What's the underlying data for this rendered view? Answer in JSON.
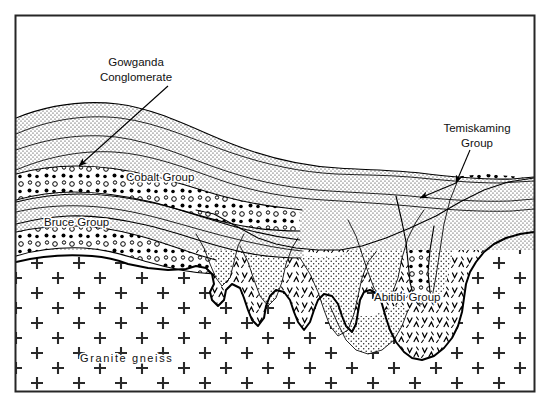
{
  "figure": {
    "kind": "geological-cross-section",
    "frame": {
      "x": 15,
      "y": 15,
      "width": 520,
      "height": 377,
      "stroke": "#222222"
    },
    "background": "#ffffff",
    "ink": "#000000"
  },
  "labels": {
    "gowganda": {
      "line1": "Gowganda",
      "line2": "Conglomerate"
    },
    "cobalt": "Cobalt Group",
    "bruce": "Bruce Group",
    "temiskaming": {
      "line1": "Temiskaming",
      "line2": "Group"
    },
    "abitibi": "Abitibi Group",
    "granite": "Granite gneiss"
  },
  "units": [
    {
      "name": "Gowganda Conglomerate",
      "pattern": "circular-clasts",
      "label": "Gowganda Conglomerate"
    },
    {
      "name": "Cobalt Group",
      "pattern": "fine-stipple",
      "label": "Cobalt Group"
    },
    {
      "name": "Bruce Group",
      "pattern": "fine-stipple",
      "label": "Bruce Group"
    },
    {
      "name": "Temiskaming Group",
      "pattern": "circular-clasts",
      "label": "Temiskaming Group"
    },
    {
      "name": "Abitibi Group",
      "pattern": "chevron-volcanic",
      "label": "Abitibi Group"
    },
    {
      "name": "Granite gneiss",
      "pattern": "plus-crosses",
      "label": "Granite gneiss"
    }
  ],
  "annotations": [
    {
      "name": "gowganda-leader",
      "from": [
        168,
        86
      ],
      "to": [
        77,
        167
      ],
      "arrow": true
    },
    {
      "name": "temiskaming-leader",
      "from": [
        470,
        150
      ],
      "to": [
        455,
        184
      ],
      "arrow": true
    },
    {
      "name": "temiskaming-leader-branch",
      "from": [
        455,
        184
      ],
      "to": [
        418,
        198
      ],
      "arrow": true
    }
  ]
}
